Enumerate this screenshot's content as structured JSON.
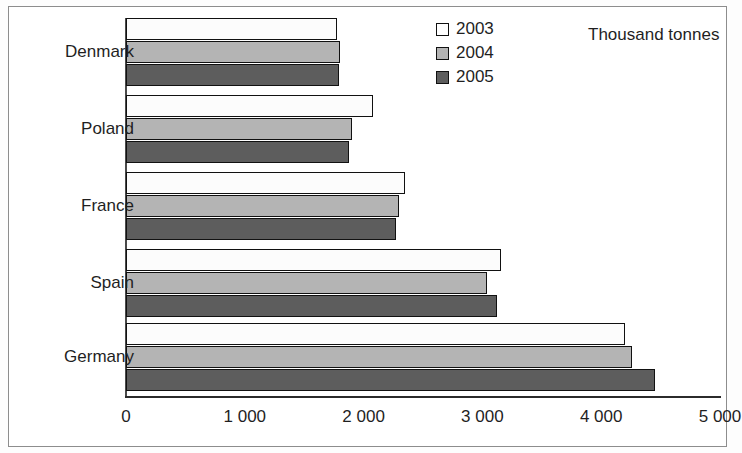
{
  "unit_title": "Thousand tonnes",
  "legend": {
    "entries": [
      {
        "label": "2003",
        "swatch": "white-square-icon",
        "color": "#ffffff"
      },
      {
        "label": "2004",
        "swatch": "light-gray-square-icon",
        "color": "#b4b4b4"
      },
      {
        "label": "2005",
        "swatch": "dark-gray-square-icon",
        "color": "#5d5d5d"
      }
    ]
  },
  "axis": {
    "tick_labels": [
      "0",
      "1 000",
      "2 000",
      "3 000",
      "4 000",
      "5 000"
    ],
    "tick_values": [
      0,
      1000,
      2000,
      3000,
      4000,
      5000
    ]
  },
  "categories": [
    "Denmark",
    "Poland",
    "France",
    "Spain",
    "Germany"
  ],
  "chart_data": {
    "type": "bar",
    "orientation": "horizontal",
    "title": "",
    "subtitle": "",
    "xlabel": "Thousand tonnes",
    "ylabel": "",
    "xlim": [
      0,
      5000
    ],
    "grid": false,
    "legend_position": "top-center",
    "categories": [
      "Denmark",
      "Poland",
      "France",
      "Spain",
      "Germany"
    ],
    "series": [
      {
        "name": "2003",
        "color": "#ffffff",
        "values": [
          1780,
          2080,
          2350,
          3160,
          4200
        ]
      },
      {
        "name": "2004",
        "color": "#b4b4b4",
        "values": [
          1800,
          1900,
          2300,
          3040,
          4260
        ]
      },
      {
        "name": "2005",
        "color": "#5d5d5d",
        "values": [
          1790,
          1880,
          2270,
          3120,
          4450
        ]
      }
    ],
    "tick_labels": [
      "0",
      "1 000",
      "2 000",
      "3 000",
      "4 000",
      "5 000"
    ]
  }
}
